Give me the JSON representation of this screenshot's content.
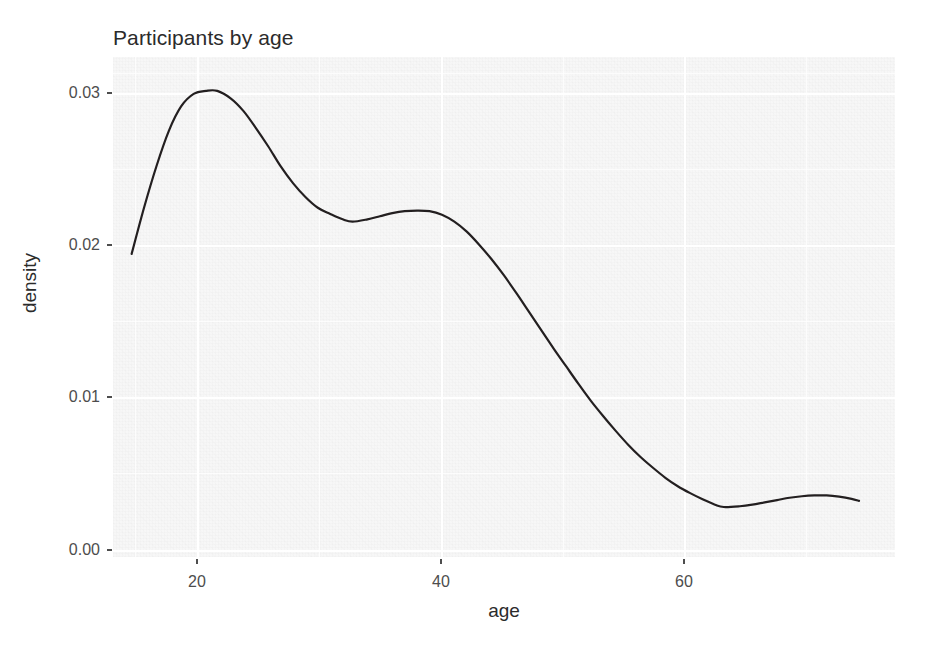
{
  "chart_data": {
    "type": "line",
    "title": "Participants by age",
    "subtitle": "",
    "xlabel": "age",
    "ylabel": "density",
    "xlim": [
      14.5,
      77.5
    ],
    "ylim": [
      0.0,
      0.0325
    ],
    "xticks": [
      20,
      40,
      60
    ],
    "xtick_labels": [
      "20",
      "40",
      "60"
    ],
    "yticks": [
      0.0,
      0.01,
      0.02,
      0.03
    ],
    "ytick_labels": [
      "0.00",
      "0.01",
      "0.02",
      "0.03"
    ],
    "grid": true,
    "legend": "none",
    "series": [
      {
        "name": "density",
        "color": "#231f20",
        "line_width": 2.2,
        "x": [
          16.0,
          17.0,
          18.0,
          19.0,
          20.0,
          21.0,
          22.0,
          22.9,
          24.0,
          25.0,
          26.0,
          27.0,
          28.0,
          29.0,
          30.0,
          31.0,
          32.0,
          33.0,
          33.8,
          35.0,
          36.0,
          37.0,
          38.0,
          39.0,
          40.0,
          41.0,
          42.0,
          43.0,
          44.0,
          45.0,
          46.0,
          47.0,
          48.0,
          49.0,
          50.0,
          51.0,
          52.0,
          53.0,
          54.0,
          55.0,
          56.0,
          57.0,
          58.0,
          59.0,
          60.0,
          61.0,
          62.0,
          63.0,
          63.7,
          65.0,
          66.0,
          67.0,
          68.0,
          69.0,
          70.0,
          71.0,
          72.0,
          73.0,
          74.0,
          74.6
        ],
        "y": [
          0.0197,
          0.0227,
          0.0254,
          0.0277,
          0.0293,
          0.0301,
          0.0303,
          0.0303,
          0.0298,
          0.029,
          0.0279,
          0.0267,
          0.0254,
          0.0243,
          0.0234,
          0.0227,
          0.0223,
          0.02195,
          0.0218,
          0.02195,
          0.02215,
          0.02235,
          0.02248,
          0.02252,
          0.02248,
          0.02225,
          0.0218,
          0.02115,
          0.0203,
          0.01935,
          0.0183,
          0.01715,
          0.01595,
          0.01475,
          0.01355,
          0.0124,
          0.01125,
          0.01015,
          0.00915,
          0.0082,
          0.0073,
          0.0065,
          0.0058,
          0.00515,
          0.0046,
          0.00415,
          0.00375,
          0.0034,
          0.00325,
          0.0033,
          0.0034,
          0.00355,
          0.0037,
          0.00385,
          0.00395,
          0.004,
          0.004,
          0.00392,
          0.00378,
          0.00365
        ]
      }
    ]
  },
  "axes": {
    "title": "Participants by age",
    "x_title": "age",
    "y_title": "density",
    "x_tick_labels": [
      "20",
      "40",
      "60"
    ],
    "y_tick_labels": [
      "0.03",
      "0.02",
      "0.01",
      "0.00"
    ]
  },
  "colors": {
    "line": "#231f20",
    "panel_background": "#f7f7f7",
    "grid": "#ffffff",
    "text": "#4d4d4d",
    "title_text": "#2b2b2b",
    "page_background": "#ffffff"
  }
}
